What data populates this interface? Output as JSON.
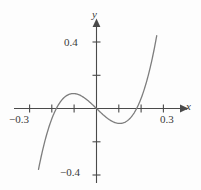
{
  "figure": {
    "background_color": "#fdfdfd",
    "curve_color": "#7d7d7d",
    "axis_color": "#4a4a4a",
    "label_color": "#3a3a3a"
  },
  "axes": {
    "x_axis_name": "x",
    "y_axis_name": "y",
    "x_labels": [
      {
        "text": "−0.3",
        "value": -0.3
      },
      {
        "text": "0.3",
        "value": 0.3
      }
    ],
    "y_labels": [
      {
        "text": "0.4",
        "value": 0.4
      },
      {
        "text": "−0.4",
        "value": -0.4
      }
    ],
    "x_ticks": [
      -0.3,
      -0.2,
      -0.1,
      0.1,
      0.2,
      0.3
    ],
    "y_ticks": [
      0.4,
      0.2,
      -0.2,
      -0.4
    ]
  },
  "chart_data": {
    "type": "line",
    "title": "",
    "xlabel": "x",
    "ylabel": "y",
    "xlim": [
      -0.36,
      0.36
    ],
    "ylim": [
      -0.48,
      0.48
    ],
    "grid": false,
    "legend": false,
    "axis_style": "arrowed-cross",
    "xtick_labels": [
      "−0.3",
      "0.3"
    ],
    "ytick_labels": [
      "0.4",
      "−0.4"
    ],
    "xticks": [
      -0.3,
      -0.2,
      -0.1,
      0.1,
      0.2,
      0.3
    ],
    "yticks": [
      0.4,
      0.2,
      -0.2,
      -0.4
    ],
    "series": [
      {
        "name": "cubic",
        "roots": [
          -0.18,
          0,
          0.18
        ],
        "local_max": {
          "x": -0.105,
          "y": 0.055
        },
        "local_min": {
          "x": 0.105,
          "y": -0.055
        },
        "x": [
          -0.26,
          -0.25,
          -0.24,
          -0.23,
          -0.22,
          -0.21,
          -0.2,
          -0.19,
          -0.18,
          -0.17,
          -0.16,
          -0.15,
          -0.14,
          -0.13,
          -0.12,
          -0.11,
          -0.1,
          -0.09,
          -0.08,
          -0.07,
          -0.06,
          -0.05,
          -0.04,
          -0.03,
          -0.02,
          -0.01,
          0.0,
          0.01,
          0.02,
          0.03,
          0.04,
          0.05,
          0.06,
          0.07,
          0.08,
          0.09,
          0.1,
          0.11,
          0.12,
          0.13,
          0.14,
          0.15,
          0.16,
          0.17,
          0.18,
          0.19,
          0.2,
          0.21,
          0.22,
          0.23,
          0.24,
          0.25,
          0.26,
          0.27
        ],
        "y": [
          -0.3327,
          -0.2813,
          -0.2347,
          -0.1926,
          -0.1551,
          -0.1217,
          -0.092,
          -0.066,
          -0.043,
          -0.023,
          -0.0056,
          0.0094,
          0.0223,
          0.0331,
          0.0421,
          0.0493,
          0.0551,
          0.0594,
          0.0625,
          0.0644,
          0.0652,
          0.0651,
          0.0642,
          0.0625,
          0.0601,
          0.0571,
          0.0,
          -0.0571,
          -0.0601,
          -0.0625,
          -0.0642,
          -0.0651,
          -0.0652,
          -0.0644,
          -0.0625,
          -0.0594,
          -0.0551,
          -0.0493,
          -0.0421,
          -0.0331,
          -0.0223,
          -0.0094,
          0.0056,
          0.023,
          0.043,
          0.066,
          0.092,
          0.1217,
          0.1551,
          0.1926,
          0.2347,
          0.2813,
          0.3327,
          0.3893
        ]
      }
    ]
  }
}
